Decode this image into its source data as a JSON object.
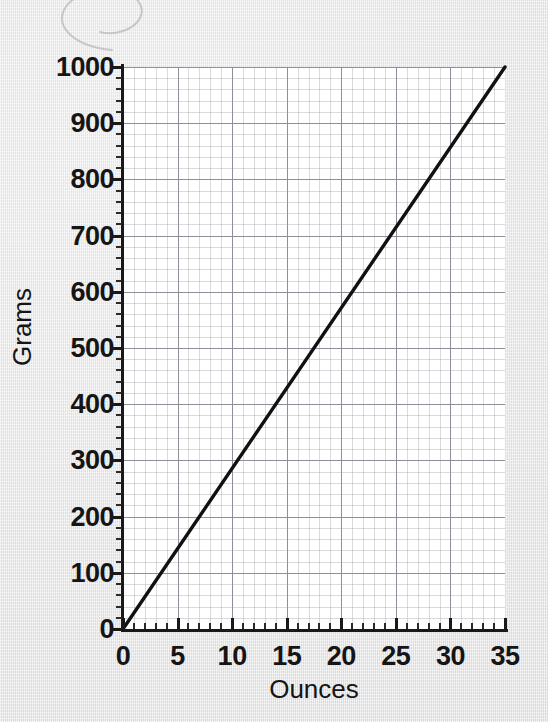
{
  "figure": {
    "background_color": "#e5e5e5",
    "plot_background_color": "#ffffff",
    "line_color": "#111111",
    "grid_minor_color": "#9696a0",
    "grid_major_color": "#6e6e7d",
    "axis_color": "#191919"
  },
  "annotations": {
    "scribble": "pencil-loop-mark"
  },
  "chart_data": {
    "type": "line",
    "title": "",
    "subtitle": "",
    "xlabel": "Ounces",
    "ylabel": "Grams",
    "xlim": [
      0,
      35
    ],
    "ylim": [
      0,
      1000
    ],
    "grid": true,
    "legend": null,
    "x_ticks": [
      0,
      5,
      10,
      15,
      20,
      25,
      30,
      35
    ],
    "x_tick_labels": [
      "0",
      "5",
      "10",
      "15",
      "20",
      "25",
      "30",
      "35"
    ],
    "y_ticks": [
      0,
      100,
      200,
      300,
      400,
      500,
      600,
      700,
      800,
      900,
      1000
    ],
    "y_tick_labels": [
      "0",
      "100",
      "200",
      "300",
      "400",
      "500",
      "600",
      "700",
      "800",
      "900",
      "1000"
    ],
    "x_minor_per_major": 5,
    "y_minor_per_major": 5,
    "series": [
      {
        "name": "Ounces to Grams conversion",
        "x": [
          0,
          5,
          10,
          15,
          20,
          25,
          30,
          35
        ],
        "values": [
          0,
          143,
          286,
          429,
          571,
          714,
          857,
          1000
        ],
        "color": "#111111",
        "linewidth": 3
      }
    ]
  }
}
